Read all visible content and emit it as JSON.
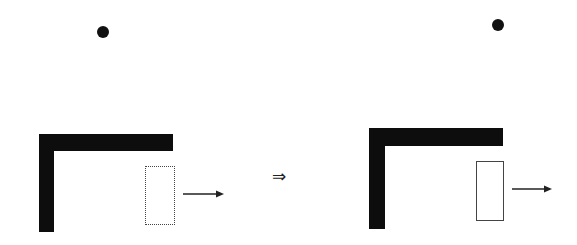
{
  "diagram": {
    "type": "before-after transformation",
    "colors": {
      "shape": "#0d0d0d",
      "outline": "#444444",
      "background": "#ffffff"
    },
    "transition_symbol": "⇒",
    "panels": [
      {
        "name": "before",
        "dot": {
          "cx": 103,
          "cy": 32,
          "r": 6
        },
        "l_shape": {
          "h_bar": {
            "x": 39,
            "y": 134,
            "w": 134,
            "h": 17
          },
          "v_bar": {
            "x": 39,
            "y": 134,
            "w": 15,
            "h": 98
          }
        },
        "rect": {
          "x": 145,
          "y": 166,
          "w": 30,
          "h": 59
        },
        "arrow": {
          "x1": 183,
          "x2": 223,
          "y": 194,
          "direction": "right"
        }
      },
      {
        "name": "after",
        "dot": {
          "cx": 498,
          "cy": 25,
          "r": 6
        },
        "l_shape": {
          "h_bar": {
            "x": 369,
            "y": 128,
            "w": 134,
            "h": 18
          },
          "v_bar": {
            "x": 369,
            "y": 128,
            "w": 16,
            "h": 101
          }
        },
        "rect": {
          "x": 476,
          "y": 161,
          "w": 28,
          "h": 60
        },
        "arrow": {
          "x1": 512,
          "x2": 551,
          "y": 189,
          "direction": "right"
        }
      }
    ]
  }
}
